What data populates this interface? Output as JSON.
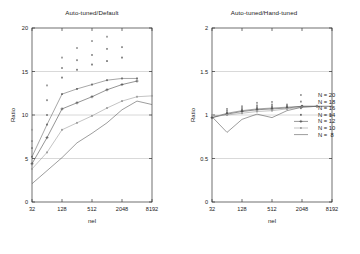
{
  "figure": {
    "background": "#ffffff",
    "ink": "#1a1a1a",
    "grid_color": "#b9b9b9"
  },
  "legend": {
    "position": "right",
    "entries": [
      {
        "label": "N = 20",
        "marker": "dot",
        "color": "#9a9a9a",
        "line": false
      },
      {
        "label": "N = 18",
        "marker": "dot",
        "color": "#8e8e8e",
        "line": false
      },
      {
        "label": "N = 16",
        "marker": "dot",
        "color": "#7d7d7d",
        "line": false
      },
      {
        "label": "N = 14",
        "marker": "dot",
        "color": "#6b6b6b",
        "line": false
      },
      {
        "label": "N = 12",
        "marker": "plus",
        "color": "#4d4d4d",
        "line": true
      },
      {
        "label": "N = 10",
        "marker": "dot",
        "color": "#9c9c9c",
        "line": true
      },
      {
        "label": "N =  8",
        "marker": "none",
        "color": "#5a5a5a",
        "line": true
      }
    ]
  },
  "chart_data": [
    {
      "type": "line",
      "id": "auto-tuned-default",
      "title": "Auto-tuned/Default",
      "xlabel": "nel",
      "ylabel": "Ratio",
      "xscale": "log2",
      "xticks": [
        32,
        128,
        512,
        2048,
        8192
      ],
      "xticklabels": [
        "32",
        "128",
        "512",
        "2048",
        "8192"
      ],
      "xlim": [
        32,
        8192
      ],
      "yticks": [
        0,
        5,
        10,
        15,
        20
      ],
      "yticklabels": [
        "0",
        "5",
        "10",
        "15",
        "20"
      ],
      "ylim": [
        0,
        20
      ],
      "grid": true,
      "x": [
        32,
        64,
        128,
        256,
        512,
        1024,
        2048,
        4096,
        8192
      ],
      "series": [
        {
          "name": "N = 20",
          "color": "#9a9a9a",
          "marker": "dot",
          "line": false,
          "values": [
            8.3,
            13.4,
            16.6,
            17.7,
            18.5,
            19.0,
            null,
            null,
            null
          ]
        },
        {
          "name": "N = 18",
          "color": "#8e8e8e",
          "marker": "dot",
          "line": false,
          "values": [
            7.0,
            11.7,
            15.4,
            16.3,
            16.9,
            17.6,
            17.8,
            null,
            null
          ]
        },
        {
          "name": "N = 16",
          "color": "#7d7d7d",
          "marker": "dot",
          "line": false,
          "values": [
            6.2,
            10.0,
            14.3,
            15.2,
            15.8,
            16.2,
            16.6,
            null,
            null
          ]
        },
        {
          "name": "N = 14",
          "color": "#6b6b6b",
          "marker": "dot",
          "line": true,
          "values": [
            5.2,
            8.9,
            12.4,
            13.0,
            13.5,
            14.0,
            14.2,
            14.2,
            null
          ]
        },
        {
          "name": "N = 12",
          "color": "#4d4d4d",
          "marker": "plus",
          "line": true,
          "values": [
            4.4,
            7.4,
            10.7,
            11.4,
            12.1,
            12.9,
            13.5,
            13.9,
            null
          ]
        },
        {
          "name": "N = 10",
          "color": "#9c9c9c",
          "marker": "dot",
          "line": true,
          "values": [
            3.8,
            5.7,
            8.3,
            9.1,
            9.9,
            10.8,
            11.6,
            12.1,
            12.2
          ]
        },
        {
          "name": "N =  8",
          "color": "#5a5a5a",
          "marker": "none",
          "line": true,
          "values": [
            2.1,
            3.6,
            5.1,
            6.8,
            7.9,
            9.1,
            10.6,
            11.6,
            11.2
          ]
        }
      ]
    },
    {
      "type": "line",
      "id": "auto-tuned-hand-tuned",
      "title": "Auto-tuned/Hand-tuned",
      "xlabel": "nel",
      "ylabel": "Ratio",
      "xscale": "log2",
      "xticks": [
        32,
        128,
        512,
        2048,
        8192
      ],
      "xticklabels": [
        "32",
        "128",
        "512",
        "2048",
        "8192"
      ],
      "xlim": [
        32,
        8192
      ],
      "yticks": [
        0,
        0.5,
        1,
        1.5,
        2
      ],
      "yticklabels": [
        "0",
        "0.5",
        "1",
        "1.5",
        "2"
      ],
      "ylim": [
        0,
        2
      ],
      "grid": true,
      "x": [
        32,
        64,
        128,
        256,
        512,
        1024,
        2048,
        4096,
        8192
      ],
      "series": [
        {
          "name": "N = 20",
          "color": "#9a9a9a",
          "marker": "dot",
          "line": false,
          "values": [
            1.0,
            1.07,
            1.1,
            1.14,
            1.15,
            1.12,
            null,
            null,
            null
          ]
        },
        {
          "name": "N = 18",
          "color": "#8e8e8e",
          "marker": "dot",
          "line": false,
          "values": [
            0.99,
            1.05,
            1.08,
            1.11,
            1.12,
            1.11,
            1.1,
            null,
            null
          ]
        },
        {
          "name": "N = 16",
          "color": "#7d7d7d",
          "marker": "dot",
          "line": false,
          "values": [
            0.98,
            1.03,
            1.06,
            1.09,
            1.1,
            1.1,
            1.1,
            null,
            null
          ]
        },
        {
          "name": "N = 14",
          "color": "#6b6b6b",
          "marker": "dot",
          "line": true,
          "values": [
            0.97,
            1.02,
            1.05,
            1.07,
            1.08,
            1.09,
            1.1,
            1.1,
            null
          ]
        },
        {
          "name": "N = 12",
          "color": "#4d4d4d",
          "marker": "plus",
          "line": true,
          "values": [
            0.97,
            1.01,
            1.04,
            1.06,
            1.07,
            1.08,
            1.1,
            1.1,
            null
          ]
        },
        {
          "name": "N = 10",
          "color": "#9c9c9c",
          "marker": "dot",
          "line": true,
          "values": [
            0.99,
            1.0,
            1.02,
            1.04,
            1.05,
            1.07,
            1.09,
            1.1,
            1.1
          ]
        },
        {
          "name": "N =  8",
          "color": "#5a5a5a",
          "marker": "none",
          "line": true,
          "values": [
            0.98,
            0.8,
            0.95,
            1.01,
            0.97,
            1.05,
            1.09,
            1.1,
            1.1
          ]
        }
      ]
    }
  ]
}
